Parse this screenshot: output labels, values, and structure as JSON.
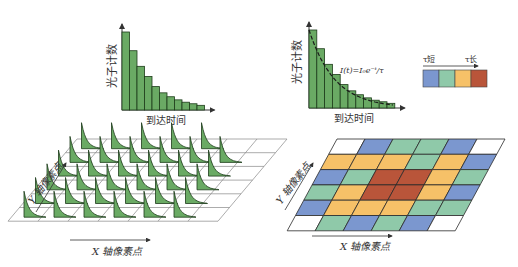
{
  "left_panel": {
    "histogram": {
      "ylabel": "光子计数",
      "xlabel": "到达时间",
      "bar_values": [
        100,
        76,
        56,
        43,
        30,
        22,
        17,
        13,
        10,
        8,
        6
      ],
      "bar_color": "#6aaa64"
    },
    "grid": {
      "xlabel": "X 轴像素点",
      "ylabel": "Y 轴像素点",
      "rows": 6,
      "cols": 7
    }
  },
  "right_panel": {
    "histogram": {
      "ylabel": "光子计数",
      "xlabel": "到达时间",
      "formula": "I(t)=I₀e⁻ᵗ/τ",
      "bar_values": [
        100,
        76,
        56,
        43,
        30,
        22,
        17,
        13,
        10,
        8,
        6
      ]
    },
    "colorbar": {
      "label_short": "τ短",
      "label_long": "τ长",
      "colors": [
        "#7b97cf",
        "#8fc9a9",
        "#f6c168",
        "#b9553a"
      ]
    },
    "grid": {
      "xlabel": "X 轴像素点",
      "ylabel": "Y 轴像素点",
      "cells": [
        [
          "W",
          "B",
          "G",
          "G",
          "B",
          "W"
        ],
        [
          "O",
          "O",
          "O",
          "G",
          "O",
          "B"
        ],
        [
          "B",
          "G",
          "R",
          "R",
          "O",
          "G"
        ],
        [
          "G",
          "O",
          "R",
          "R",
          "O",
          "B"
        ],
        [
          "B",
          "O",
          "O",
          "O",
          "G",
          "G"
        ],
        [
          "W",
          "G",
          "B",
          "G",
          "B",
          "W"
        ]
      ],
      "palette": {
        "W": "#ffffff",
        "B": "#7b97cf",
        "G": "#8fc9a9",
        "O": "#f6c168",
        "R": "#b9553a"
      }
    }
  }
}
